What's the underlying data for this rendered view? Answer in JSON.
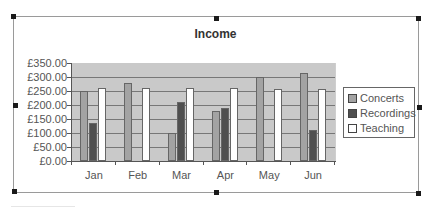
{
  "chart_data": {
    "type": "bar",
    "title": "Income",
    "categories": [
      "Jan",
      "Feb",
      "Mar",
      "Apr",
      "May",
      "Jun"
    ],
    "series": [
      {
        "name": "Concerts",
        "color": "#a3a3a3",
        "values": [
          250,
          280,
          100,
          180,
          300,
          315
        ]
      },
      {
        "name": "Recordings",
        "color": "#4f4f4f",
        "values": [
          135,
          0,
          210,
          190,
          0,
          110
        ]
      },
      {
        "name": "Teaching",
        "color": "#ffffff",
        "values": [
          260,
          260,
          260,
          260,
          257,
          257
        ]
      }
    ],
    "xlabel": "",
    "ylabel": "",
    "ylim": [
      0,
      350
    ],
    "yticks": [
      "£0.00",
      "£50.00",
      "£100.00",
      "£150.00",
      "£200.00",
      "£250.00",
      "£300.00",
      "£350.00"
    ],
    "grid": true,
    "legend_position": "right",
    "plot_background": "#c9c9c9"
  }
}
